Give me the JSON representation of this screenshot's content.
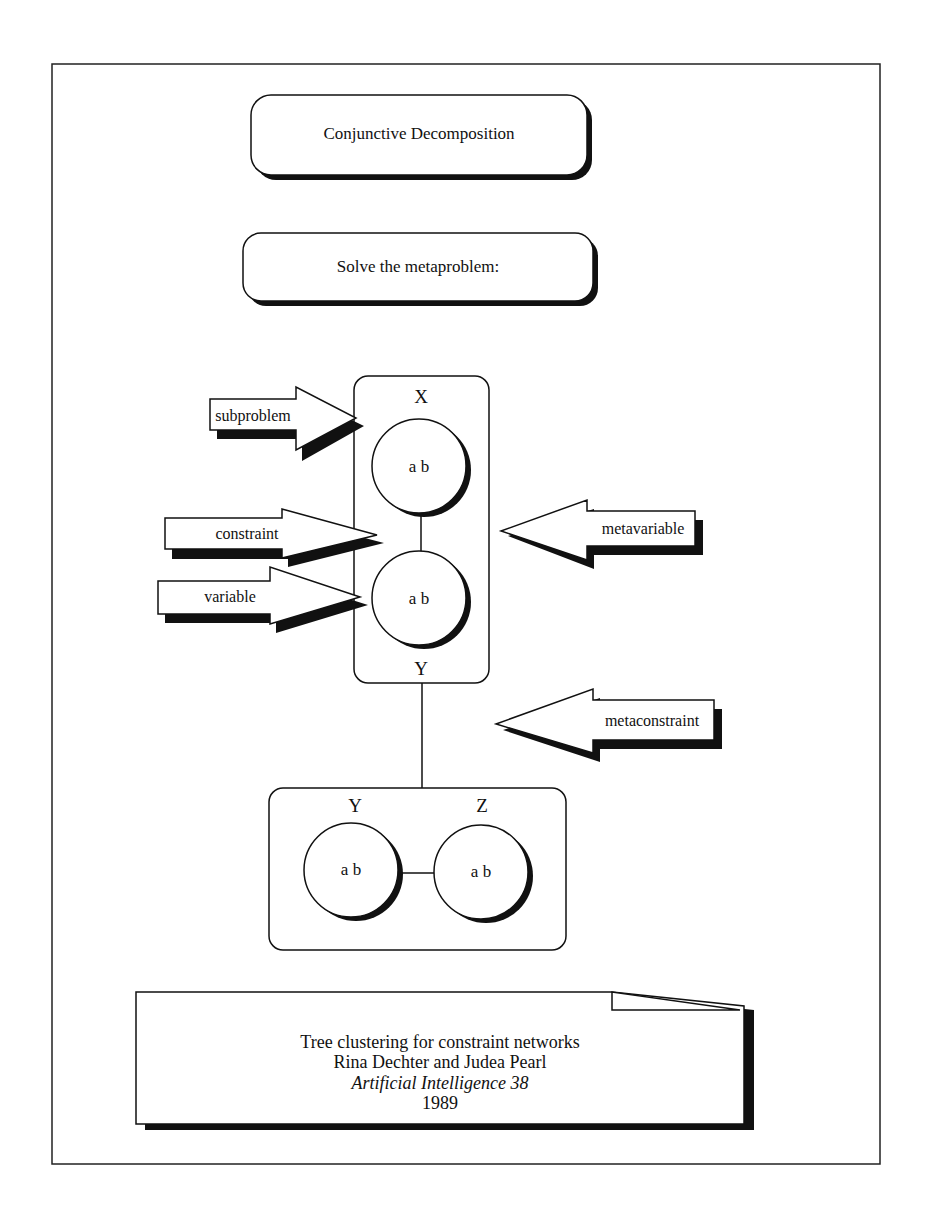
{
  "title_box": {
    "label": "Conjunctive Decomposition"
  },
  "subtitle_box": {
    "label": "Solve the metaproblem:"
  },
  "metavariable_upper": {
    "top_label": "X",
    "bottom_label": "Y",
    "nodes": [
      {
        "values": "a b"
      },
      {
        "values": "a b"
      }
    ]
  },
  "metavariable_lower": {
    "labels": [
      "Y",
      "Z"
    ],
    "nodes": [
      {
        "values": "a b"
      },
      {
        "values": "a b"
      }
    ]
  },
  "callouts": {
    "subproblem": "subproblem",
    "constraint": "constraint",
    "variable": "variable",
    "metavariable": "metavariable",
    "metaconstraint": "metaconstraint"
  },
  "citation": {
    "title": "Tree clustering for constraint networks",
    "authors": "Rina Dechter and Judea Pearl",
    "journal": "Artificial Intelligence 38",
    "year": "1989"
  },
  "colors": {
    "ink": "#111111",
    "paper": "#ffffff"
  }
}
